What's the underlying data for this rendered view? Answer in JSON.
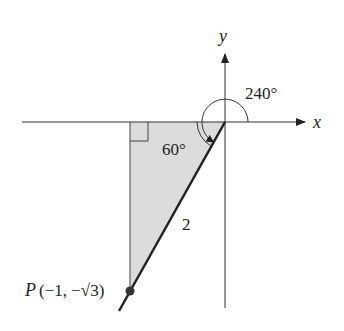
{
  "diagram": {
    "axes": {
      "x_label": "x",
      "y_label": "y"
    },
    "angles": {
      "reference_angle_label": "60°",
      "standard_angle_label": "240°"
    },
    "segment": {
      "hypotenuse_label": "2"
    },
    "point": {
      "name": "P",
      "coords_label": "(−1, −√3)"
    },
    "colors": {
      "line": "#222222",
      "triangle_fill": "#dcdcdc",
      "background": "#ffffff"
    }
  }
}
